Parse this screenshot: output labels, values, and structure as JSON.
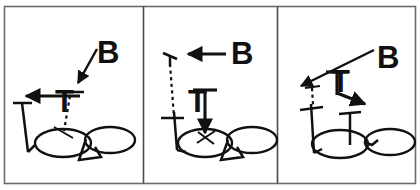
{
  "figure": {
    "panel_count": 3,
    "canvas": {
      "width": 420,
      "height": 190
    },
    "style": {
      "ink_color": "#111111",
      "frame_color": "#6b6b6b",
      "background": "#ffffff"
    },
    "panels": [
      {
        "id": "panel-1",
        "index": 1,
        "label_b": "B",
        "label_t": "T",
        "b_arrow": {
          "direction": "down-left",
          "description": "diagonal arrow from B label pointing down-left toward the T cross-bar"
        },
        "t_arrow": {
          "direction": "left",
          "description": "horizontal arrow pointing left from the T stem"
        },
        "dashed_segment": "short dashed line descending from T cross-bar to upper ellipse",
        "ellipses": 2
      },
      {
        "id": "panel-2",
        "index": 2,
        "label_b": "B",
        "label_t": "T",
        "b_arrow": {
          "direction": "left",
          "description": "horizontal arrow pointing left from the B label"
        },
        "t_arrow": {
          "direction": "down",
          "description": "vertical arrow pointing down from the T cross-bar into the left ellipse"
        },
        "dashed_segment": "long dashed line from tilted tick at top down to cross mark at lower left",
        "ellipses": 2
      },
      {
        "id": "panel-3",
        "index": 3,
        "label_b": "B",
        "label_t": "T",
        "b_arrow": {
          "direction": "down-left",
          "description": "long diagonal arrow from B label pointing down-left"
        },
        "t_arrow": {
          "direction": "down-right",
          "description": "arrow bending down then right from the T stem"
        },
        "dashed_segment": "short dashed line below the left arrow tip down to cross mark",
        "ellipses": 2
      }
    ]
  }
}
